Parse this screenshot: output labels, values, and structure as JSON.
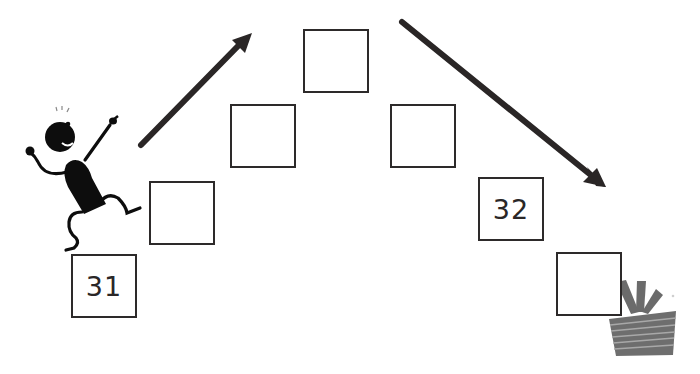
{
  "puzzle": {
    "description": "Number sequence staircase: count up then down from 31 to 32",
    "boxes": [
      {
        "value": "31",
        "x": 71,
        "y": 254
      },
      {
        "value": "",
        "x": 149,
        "y": 181
      },
      {
        "value": "",
        "x": 230,
        "y": 104
      },
      {
        "value": "",
        "x": 303,
        "y": 29
      },
      {
        "value": "",
        "x": 390,
        "y": 104
      },
      {
        "value": "32",
        "x": 478,
        "y": 177
      },
      {
        "value": "",
        "x": 556,
        "y": 252
      }
    ],
    "arrows": [
      {
        "direction": "up-right",
        "icon": "arrow-up-right-icon"
      },
      {
        "direction": "down-right",
        "icon": "arrow-down-right-icon"
      }
    ],
    "figures": {
      "character": "stick-figure-climbing-icon",
      "goal": "gift-box-icon"
    }
  },
  "colors": {
    "ink": "#2d2a2a",
    "figure": "#0d0d0d",
    "gift": "#6e6e6e",
    "gift_stripe": "#9a9a9a",
    "background": "#ffffff"
  }
}
